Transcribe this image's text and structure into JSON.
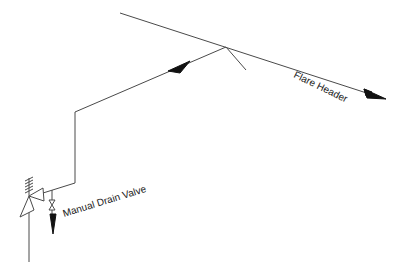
{
  "diagram": {
    "type": "piping isometric sketch",
    "labels": {
      "flare_header": "Flare Header",
      "drain_valve": "Manual Drain Valve"
    },
    "components": [
      {
        "name": "relief-valve",
        "symbol": "pressure relief valve with spring"
      },
      {
        "name": "manual-drain-valve",
        "symbol": "gate valve (bowtie)"
      },
      {
        "name": "flare-header",
        "symbol": "pipe line with flow arrow"
      },
      {
        "name": "relief-discharge-line",
        "symbol": "pipe line with flow arrow"
      }
    ],
    "colors": {
      "line": "#4a4a4a",
      "arrow": "#111111",
      "background": "#ffffff"
    }
  }
}
